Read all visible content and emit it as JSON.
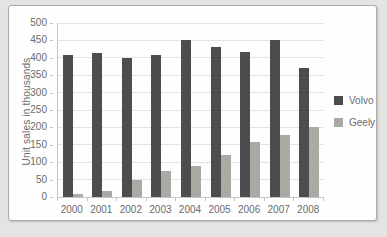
{
  "window": {
    "background_color": "#e6e4e3",
    "panel_background": "#fefefe",
    "panel_border_color": "#aeaaa7"
  },
  "chart_data": {
    "type": "bar",
    "title": "",
    "xlabel": "",
    "ylabel": "Unit sales in thousands",
    "categories": [
      "2000",
      "2001",
      "2002",
      "2003",
      "2004",
      "2005",
      "2006",
      "2007",
      "2008"
    ],
    "series": [
      {
        "name": "Volvo",
        "color": "#4d4d4d",
        "values": [
          408,
          415,
          400,
          408,
          450,
          430,
          418,
          450,
          370
        ]
      },
      {
        "name": "Geely",
        "color": "#a8aaa3",
        "values": [
          10,
          18,
          50,
          75,
          90,
          120,
          158,
          178,
          200
        ]
      }
    ],
    "ylim": [
      0,
      500
    ],
    "yticks": [
      0,
      50,
      100,
      150,
      200,
      250,
      300,
      350,
      400,
      450,
      500
    ],
    "grid": true,
    "gridline_color": "#e3e3e3",
    "axis_color": "#c6c6c6",
    "tick_label_color": "#6b6b6b",
    "legend_position": "right"
  }
}
